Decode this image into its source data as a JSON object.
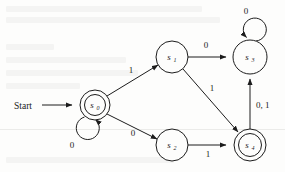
{
  "figure": {
    "kind": "finite-state-machine-diagram",
    "background_color": "#fdfdfc",
    "ink_color": "#1c1c1c",
    "start_label": "Start"
  },
  "states": [
    {
      "id": "s0",
      "label": "s",
      "sub": "0",
      "cx": 95,
      "cy": 105,
      "r": 15,
      "accepting": true,
      "name": "state-s0"
    },
    {
      "id": "s1",
      "label": "s",
      "sub": "1",
      "cx": 172,
      "cy": 57,
      "r": 16,
      "accepting": false,
      "name": "state-s1"
    },
    {
      "id": "s2",
      "label": "s",
      "sub": "2",
      "cx": 172,
      "cy": 145,
      "r": 16,
      "accepting": false,
      "name": "state-s2"
    },
    {
      "id": "s3",
      "label": "s",
      "sub": "3",
      "cx": 250,
      "cy": 57,
      "r": 17,
      "accepting": false,
      "name": "state-s3"
    },
    {
      "id": "s4",
      "label": "s",
      "sub": "4",
      "cx": 250,
      "cy": 145,
      "r": 16,
      "accepting": true,
      "name": "state-s4"
    }
  ],
  "transitions": [
    {
      "id": "t-start",
      "from": "start",
      "to": "s0",
      "label": "",
      "name": "transition-start-to-s0"
    },
    {
      "id": "t-s0-s0",
      "from": "s0",
      "to": "s0",
      "label": "0",
      "name": "transition-s0-to-s0"
    },
    {
      "id": "t-s0-s1",
      "from": "s0",
      "to": "s1",
      "label": "1",
      "name": "transition-s0-to-s1"
    },
    {
      "id": "t-s0-s2",
      "from": "s0",
      "to": "s2",
      "label": "0",
      "name": "transition-s0-to-s2"
    },
    {
      "id": "t-s1-s3",
      "from": "s1",
      "to": "s3",
      "label": "0",
      "name": "transition-s1-to-s3"
    },
    {
      "id": "t-s1-s4",
      "from": "s1",
      "to": "s4",
      "label": "1",
      "name": "transition-s1-to-s4"
    },
    {
      "id": "t-s2-s4",
      "from": "s2",
      "to": "s4",
      "label": "1",
      "name": "transition-s2-to-s4"
    },
    {
      "id": "t-s3-s3",
      "from": "s3",
      "to": "s3",
      "label": "0",
      "name": "transition-s3-to-s3"
    },
    {
      "id": "t-s4-s3",
      "from": "s4",
      "to": "s3",
      "label": "0, 1",
      "name": "transition-s4-to-s3"
    }
  ],
  "labels": {
    "start": "Start",
    "s0": "s",
    "s0_sub": "0",
    "s1": "s",
    "s1_sub": "1",
    "s2": "s",
    "s2_sub": "2",
    "s3": "s",
    "s3_sub": "3",
    "s4": "s",
    "s4_sub": "4",
    "loop_s0": "0",
    "loop_s3": "0",
    "s0_s1": "1",
    "s0_s2": "0",
    "s1_s3": "0",
    "s1_s4": "1",
    "s2_s4": "1",
    "s4_s3": "0, 1"
  }
}
